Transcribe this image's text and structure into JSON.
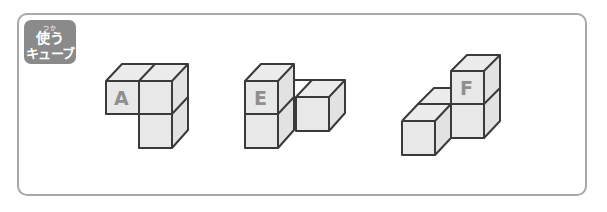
{
  "badge": {
    "ruby": "つか",
    "line1": "使う",
    "line2": "キューブ"
  },
  "figures": [
    {
      "id": "A",
      "label": "A"
    },
    {
      "id": "E",
      "label": "E"
    },
    {
      "id": "F",
      "label": "F"
    }
  ],
  "colors": {
    "frame_border": "#a8a8a8",
    "badge_bg": "#8a8a8a",
    "cube_edge": "#3a3a3a",
    "cube_face": "#e8e8e8",
    "label": "#8f8f8f"
  }
}
